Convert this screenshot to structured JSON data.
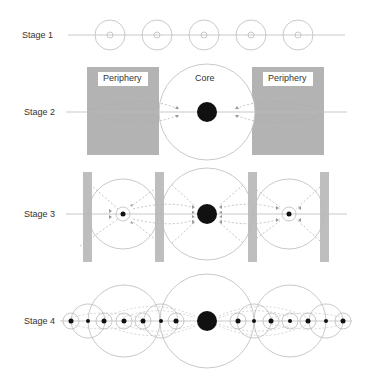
{
  "stages": [
    {
      "label": "Stage 1"
    },
    {
      "label": "Stage 2",
      "core_label": "Core",
      "periphery_left_label": "Periphery",
      "periphery_right_label": "Periphery"
    },
    {
      "label": "Stage 3"
    },
    {
      "label": "Stage 4"
    }
  ],
  "colors": {
    "line": "#bbbbbb",
    "circle": "#bbbbbb",
    "periphery": "#b3b3b3",
    "bar": "#b8b8b8",
    "dot": "#111111",
    "dash": "#999999"
  }
}
